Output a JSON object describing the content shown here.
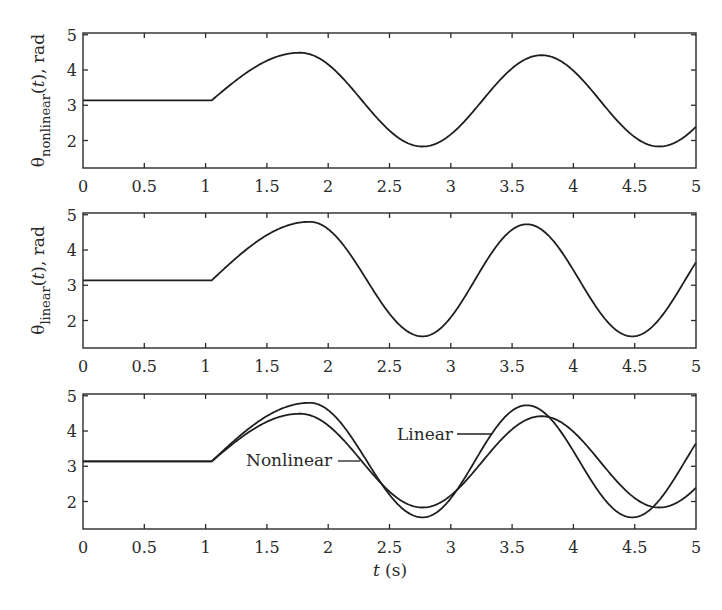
{
  "figure": {
    "xlabel": "t (s)",
    "xlabel_var": "t",
    "xlabel_unit": " (s)",
    "panels": [
      {
        "id": "nonlinear",
        "ylabel_prefix": "θ",
        "ylabel_sub": "nonlinear",
        "ylabel_mid": "(",
        "ylabel_var": "t",
        "ylabel_suffix": "), rad",
        "series": [
          "nonlinear"
        ]
      },
      {
        "id": "linear",
        "ylabel_prefix": "θ",
        "ylabel_sub": "linear",
        "ylabel_mid": "(",
        "ylabel_var": "t",
        "ylabel_suffix": "), rad",
        "series": [
          "linear"
        ]
      },
      {
        "id": "comparison",
        "ylabel_prefix": "",
        "ylabel_sub": "",
        "ylabel_mid": "",
        "ylabel_var": "",
        "ylabel_suffix": "",
        "series": [
          "nonlinear",
          "linear"
        ],
        "annotations": [
          {
            "text": "Linear",
            "series": "linear"
          },
          {
            "text": "Nonlinear",
            "series": "nonlinear"
          }
        ]
      }
    ],
    "xticks": [
      0,
      0.5,
      1,
      1.5,
      2,
      2.5,
      3,
      3.5,
      4,
      4.5,
      5
    ],
    "xtick_labels": [
      "0",
      "0.5",
      "1",
      "1.5",
      "2",
      "2.5",
      "3",
      "3.5",
      "4",
      "4.5",
      "5"
    ],
    "yticks": [
      2,
      3,
      4,
      5
    ],
    "ytick_labels": [
      "2",
      "3",
      "4",
      "5"
    ],
    "xlim": [
      0,
      5
    ],
    "ylim": [
      1.22,
      5.05
    ],
    "line_color": "#1f1f1f"
  },
  "chart_data": {
    "type": "line",
    "title": "",
    "xlabel": "t (s)",
    "xlim": [
      0,
      5
    ],
    "ylim": [
      1.2,
      5.05
    ],
    "grid": false,
    "legend": "inline annotations (bottom panel): Linear, Nonlinear",
    "panels": [
      {
        "ylabel": "θ_nonlinear(t), rad",
        "series": [
          "Nonlinear"
        ]
      },
      {
        "ylabel": "θ_linear(t), rad",
        "series": [
          "Linear"
        ]
      },
      {
        "ylabel": "",
        "series": [
          "Nonlinear",
          "Linear"
        ],
        "annotations": [
          "Linear",
          "Nonlinear"
        ]
      }
    ],
    "x": [
      0,
      0.25,
      0.5,
      0.75,
      1.0,
      1.25,
      1.5,
      1.75,
      2.0,
      2.25,
      2.5,
      2.75,
      3.0,
      3.25,
      3.5,
      3.75,
      4.0,
      4.25,
      4.5,
      4.75,
      5.0
    ],
    "series": [
      {
        "name": "Nonlinear",
        "values": [
          3.14,
          3.14,
          3.14,
          3.14,
          3.14,
          3.71,
          4.26,
          4.49,
          4.16,
          3.24,
          2.28,
          1.83,
          2.17,
          3.1,
          4.02,
          4.42,
          3.98,
          3.0,
          2.09,
          1.85,
          2.38
        ],
        "start_time": 1.05,
        "initial_value": 3.14,
        "extrema": [
          {
            "t": 1.77,
            "v": 4.49
          },
          {
            "t": 2.77,
            "v": 1.83
          },
          {
            "t": 3.74,
            "v": 4.42
          },
          {
            "t": 4.7,
            "v": 1.83
          },
          {
            "t": 5.67,
            "v": 4.4
          }
        ]
      },
      {
        "name": "Linear",
        "values": [
          3.14,
          3.14,
          3.14,
          3.14,
          3.14,
          3.78,
          4.42,
          4.77,
          4.59,
          3.5,
          2.2,
          1.55,
          2.09,
          3.46,
          4.58,
          4.56,
          3.43,
          2.11,
          1.56,
          2.26,
          3.65
        ],
        "start_time": 1.05,
        "initial_value": 3.14,
        "extrema": [
          {
            "t": 1.85,
            "v": 4.8
          },
          {
            "t": 2.77,
            "v": 1.55
          },
          {
            "t": 3.62,
            "v": 4.73
          },
          {
            "t": 4.48,
            "v": 1.55
          },
          {
            "t": 5.34,
            "v": 4.73
          }
        ]
      }
    ]
  }
}
